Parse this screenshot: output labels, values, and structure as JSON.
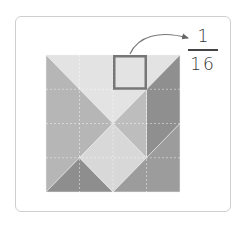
{
  "figure": {
    "grid": {
      "rows": 4,
      "cols": 4
    },
    "pieces": [
      {
        "name": "top-large-triangle",
        "points": [
          [
            0,
            0
          ],
          [
            4,
            0
          ],
          [
            2,
            2
          ]
        ],
        "color": "#e3e3e3"
      },
      {
        "name": "left-large-triangle",
        "points": [
          [
            0,
            0
          ],
          [
            2,
            2
          ],
          [
            0,
            4
          ]
        ],
        "color": "#b6b6b6"
      },
      {
        "name": "bottom-left-small-triangle",
        "points": [
          [
            0,
            4
          ],
          [
            1,
            3
          ],
          [
            2,
            4
          ]
        ],
        "color": "#8e8e8e"
      },
      {
        "name": "center-square",
        "points": [
          [
            2,
            2
          ],
          [
            3,
            3
          ],
          [
            2,
            4
          ],
          [
            1,
            3
          ]
        ],
        "color": "#d8d8d8"
      },
      {
        "name": "middle-small-triangle",
        "points": [
          [
            2,
            2
          ],
          [
            3,
            1
          ],
          [
            3,
            3
          ]
        ],
        "color": "#bdbdbd"
      },
      {
        "name": "right-parallelogram",
        "points": [
          [
            3,
            1
          ],
          [
            4,
            0
          ],
          [
            4,
            2
          ],
          [
            3,
            3
          ]
        ],
        "color": "#8f8f8f"
      },
      {
        "name": "bottom-right-medium-triangle",
        "points": [
          [
            2,
            4
          ],
          [
            4,
            2
          ],
          [
            4,
            4
          ]
        ],
        "color": "#9c9c9c"
      }
    ],
    "highlight_cell": {
      "col": 2,
      "row": 0,
      "border_color": "#777777"
    },
    "fraction": {
      "numerator": "1",
      "denominator": "16"
    }
  }
}
